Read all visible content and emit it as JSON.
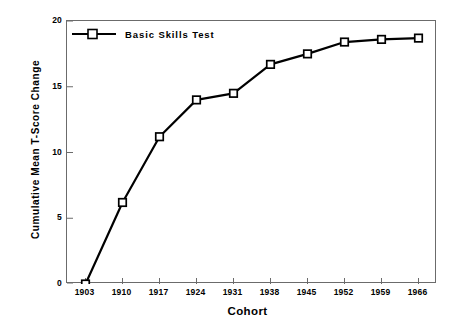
{
  "chart_data": {
    "type": "line",
    "title": "",
    "xlabel": "Cohort",
    "ylabel": "Cumulative Mean T-Score Change",
    "x": [
      1903,
      1910,
      1917,
      1924,
      1931,
      1938,
      1945,
      1952,
      1959,
      1966
    ],
    "categories": [
      "1903",
      "1910",
      "1917",
      "1924",
      "1931",
      "1938",
      "1945",
      "1952",
      "1959",
      "1966"
    ],
    "series": [
      {
        "name": "Basic Skills Test",
        "values": [
          0,
          6.2,
          11.2,
          14.0,
          14.5,
          16.7,
          17.5,
          18.4,
          18.6,
          18.7
        ],
        "marker": "open-square",
        "color": "#000000"
      }
    ],
    "xlim": [
      1899.5,
      1969.5
    ],
    "ylim": [
      0,
      20
    ],
    "yticks": [
      0,
      5,
      10,
      15,
      20
    ],
    "ytick_labels": [
      "0",
      "5",
      "10",
      "15",
      "20"
    ],
    "xticks": [
      1903,
      1910,
      1917,
      1924,
      1931,
      1938,
      1945,
      1952,
      1959,
      1966
    ],
    "grid": false,
    "legend_position": "top-left",
    "frame_color": "#6b6b6b",
    "line_color": "#000000",
    "background": "#ffffff"
  },
  "legend": {
    "entries": [
      {
        "label": "Basic Skills Test",
        "marker": "open-square",
        "color": "#000000"
      }
    ]
  },
  "axes": {
    "x_title": "Cohort",
    "y_title": "Cumulative Mean T-Score Change"
  }
}
